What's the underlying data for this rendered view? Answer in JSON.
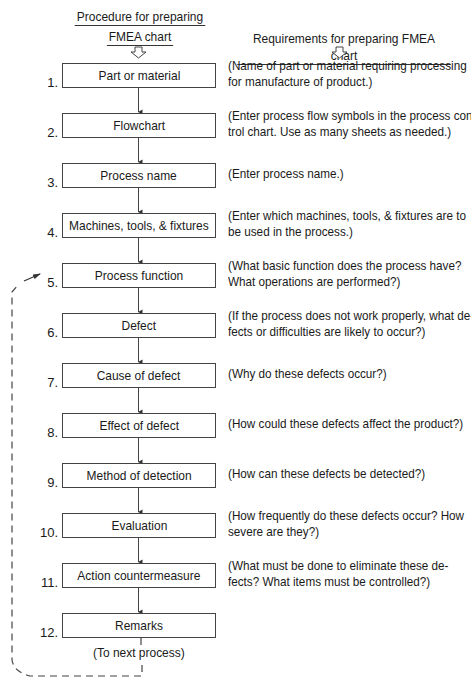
{
  "headers": {
    "left_line1": "Procedure for preparing",
    "left_line2": "FMEA chart",
    "right": "Requirements for preparing FMEA chart"
  },
  "steps": [
    {
      "num": "1.",
      "label": "Part or material",
      "desc": [
        "(Name of part or material requiring processing",
        "for manufacture of product.)"
      ]
    },
    {
      "num": "2.",
      "label": "Flowchart",
      "desc": [
        "(Enter process flow symbols in the process con-",
        "trol chart. Use as many sheets as needed.)"
      ]
    },
    {
      "num": "3.",
      "label": "Process name",
      "desc": [
        "(Enter process name.)"
      ]
    },
    {
      "num": "4.",
      "label": "Machines, tools, & fixtures",
      "desc": [
        "(Enter which machines, tools, & fixtures are to",
        "be used in the process.)"
      ]
    },
    {
      "num": "5.",
      "label": "Process function",
      "desc": [
        "(What basic function does the process have?",
        "What operations are performed?)"
      ]
    },
    {
      "num": "6.",
      "label": "Defect",
      "desc": [
        "(If the process does not work properly, what de-",
        "fects or difficulties are likely to occur?)"
      ]
    },
    {
      "num": "7.",
      "label": "Cause of defect",
      "desc": [
        "(Why do these defects occur?)"
      ]
    },
    {
      "num": "8.",
      "label": "Effect of defect",
      "desc": [
        "(How could these defects affect the product?)"
      ]
    },
    {
      "num": "9.",
      "label": "Method of detection",
      "desc": [
        "(How can these defects be detected?)"
      ]
    },
    {
      "num": "10.",
      "label": "Evaluation",
      "desc": [
        "(How frequently do these defects occur? How",
        "severe are they?)"
      ]
    },
    {
      "num": "11.",
      "label": "Action countermeasure",
      "desc": [
        "(What must be done to eliminate these de-",
        "fects? What items must be controlled?)"
      ]
    },
    {
      "num": "12.",
      "label": "Remarks",
      "desc": []
    }
  ],
  "footer": {
    "next_process": "(To next process)"
  },
  "colors": {
    "line": "#444444",
    "text": "#1a1a1a",
    "background": "#ffffff"
  }
}
